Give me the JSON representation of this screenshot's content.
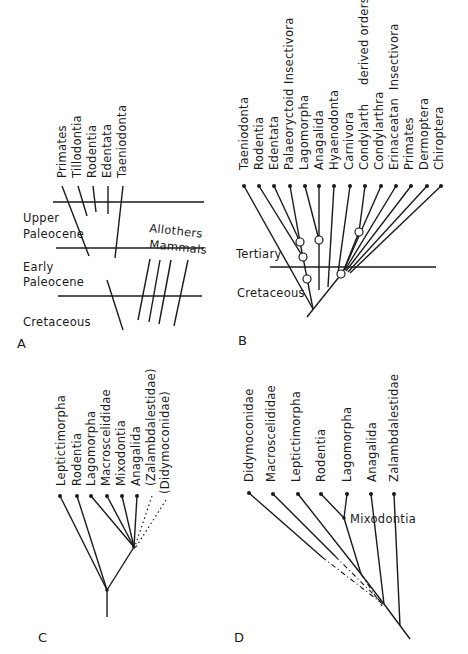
{
  "figure": {
    "panels": {
      "A": {
        "letter": "A",
        "taxa": [
          "Primates",
          "Tillodontia",
          "Rodentia",
          "Edentata",
          "Taeniodonta"
        ],
        "periods": [
          "Upper Paleocene",
          "Early Paleocene",
          "Cretaceous"
        ],
        "period_lines": {
          "upper": "Upper",
          "upper2": "Paleocene",
          "early": "Early",
          "early2": "Paleocene",
          "cretaceous": "Cretaceous"
        },
        "allothers": {
          "line1": "Allothers",
          "line2": "Mammals"
        }
      },
      "B": {
        "letter": "B",
        "taxa": [
          "Taeniodonta",
          "Rodentia",
          "Edentata",
          "Palaeoryctoid",
          "Lagomorpha",
          "Anagalida",
          "Hyaenodonta",
          "Carnivora",
          "Condylarth",
          "Condylarthra",
          "Erinaceatan",
          "Primates",
          "Dermoptera",
          "Chiroptera"
        ],
        "annotations": {
          "insectivora_1": "Insectivora",
          "derived_orders": "derived   orders",
          "insectivora_2": "Insectivora"
        },
        "periods": {
          "tertiary": "Tertiary",
          "cretaceous": "Cretaceous"
        }
      },
      "C": {
        "letter": "C",
        "taxa": [
          "Leptictimorpha",
          "Rodentia",
          "Lagomorpha",
          "Macroscelididae",
          "Mixodontia",
          "Anagalida",
          "(Zalambdalestidae)",
          "(Didymoconidae)"
        ]
      },
      "D": {
        "letter": "D",
        "taxa": [
          "Didymoconidae",
          "Macroscelididae",
          "Leptictimorpha",
          "Rodentia",
          "Lagomorpha",
          "Anagalida",
          "Zalambdalestidae"
        ],
        "inner_label": "Mixodontia"
      }
    }
  }
}
